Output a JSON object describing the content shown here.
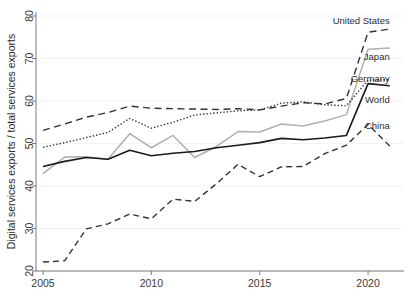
{
  "chart_data": {
    "type": "line",
    "title": "",
    "xlabel": "",
    "ylabel": "Digital services exports / total services exports",
    "xlim": [
      2005,
      2021
    ],
    "ylim": [
      20,
      80
    ],
    "grid": true,
    "legend_position": "inline-right-end-of-line",
    "x_ticks": [
      "2005",
      "2010",
      "2015",
      "2020"
    ],
    "x_tick_values": [
      2005,
      2010,
      2015,
      2020
    ],
    "y_ticks": [
      "20",
      "30",
      "40",
      "50",
      "60",
      "70",
      "80"
    ],
    "y_tick_values": [
      20,
      30,
      40,
      50,
      60,
      70,
      80
    ],
    "x": [
      2005,
      2006,
      2007,
      2008,
      2009,
      2010,
      2011,
      2012,
      2013,
      2014,
      2015,
      2016,
      2017,
      2018,
      2019,
      2020,
      2021
    ],
    "series": [
      {
        "name": "United States",
        "style": "long-dashed",
        "color": "#333333",
        "label_x": 2021.0,
        "label_y": 79.0,
        "values": [
          53.1,
          54.6,
          56.2,
          57.3,
          58.8,
          58.3,
          58.2,
          58.1,
          58.0,
          58.2,
          57.9,
          58.8,
          59.6,
          59.3,
          60.6,
          76.2,
          76.9
        ]
      },
      {
        "name": "Japan",
        "style": "solid-gray",
        "color": "#b0b0b0",
        "label_x": 2021.0,
        "label_y": 70.5,
        "values": [
          42.9,
          46.8,
          46.9,
          46.3,
          52.3,
          49.0,
          51.9,
          46.7,
          49.3,
          52.8,
          52.7,
          54.6,
          54.1,
          55.3,
          56.8,
          72.2,
          72.5
        ]
      },
      {
        "name": "Germany",
        "style": "dotted",
        "color": "#333333",
        "label_x": 2021.0,
        "label_y": 65.2,
        "values": [
          49.1,
          50.2,
          51.4,
          52.6,
          55.9,
          53.6,
          55.0,
          56.7,
          57.2,
          57.7,
          57.9,
          59.5,
          59.8,
          59.1,
          58.9,
          64.9,
          65.0
        ]
      },
      {
        "name": "World",
        "style": "solid-black",
        "color": "#1a1a1a",
        "label_x": 2021.0,
        "label_y": 60.3,
        "values": [
          44.6,
          45.8,
          46.7,
          46.3,
          48.4,
          47.1,
          47.7,
          48.1,
          49.0,
          49.6,
          50.2,
          51.2,
          50.9,
          51.3,
          51.9,
          64.1,
          63.6
        ]
      },
      {
        "name": "China",
        "style": "dashed",
        "color": "#333333",
        "label_x": 2021.0,
        "label_y": 54.3,
        "values": [
          22.1,
          22.4,
          29.9,
          31.1,
          33.4,
          32.3,
          36.9,
          36.4,
          40.5,
          45.1,
          42.2,
          44.5,
          44.6,
          47.6,
          49.6,
          54.5,
          49.4
        ]
      }
    ]
  },
  "axis": {
    "y_title": "Digital services exports / total services exports"
  }
}
